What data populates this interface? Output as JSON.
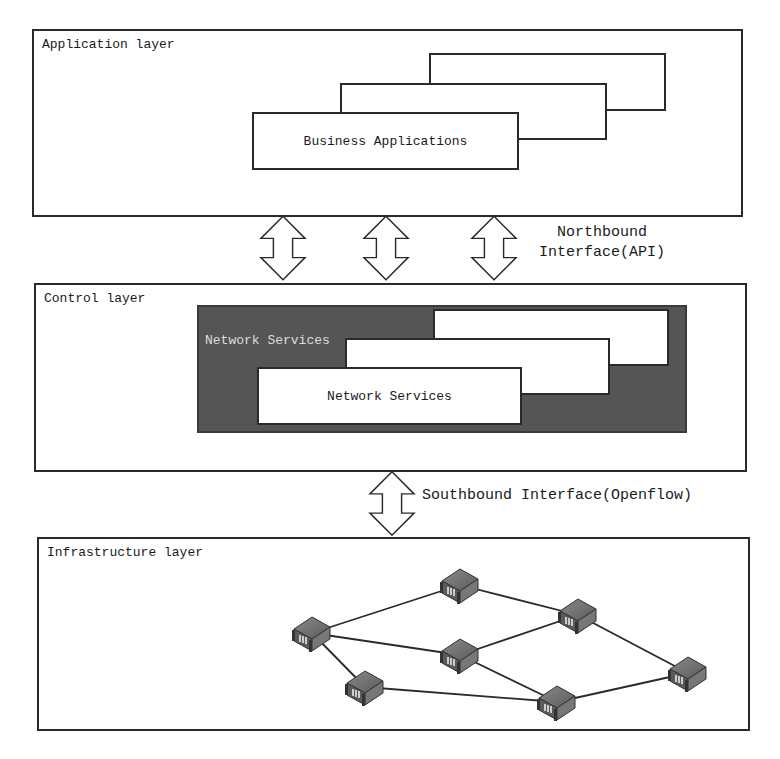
{
  "application_layer": {
    "title": "Application layer",
    "front_box_label": "Business Applications"
  },
  "northbound": {
    "line1": "Northbound",
    "line2": "Interface(API)"
  },
  "control_layer": {
    "title": "Control layer",
    "dark_panel_label": "Network Services",
    "front_box_label": "Network Services"
  },
  "southbound": {
    "label": "Southbound Interface(Openflow)"
  },
  "infrastructure_layer": {
    "title": "Infrastructure layer",
    "nodes": [
      {
        "id": "n1",
        "x": 312,
        "y": 633
      },
      {
        "id": "n2",
        "x": 460,
        "y": 585
      },
      {
        "id": "n3",
        "x": 578,
        "y": 615
      },
      {
        "id": "n4",
        "x": 460,
        "y": 655
      },
      {
        "id": "n5",
        "x": 365,
        "y": 687
      },
      {
        "id": "n6",
        "x": 557,
        "y": 702
      },
      {
        "id": "n7",
        "x": 688,
        "y": 673
      }
    ],
    "edges": [
      [
        "n1",
        "n2"
      ],
      [
        "n1",
        "n4"
      ],
      [
        "n1",
        "n5"
      ],
      [
        "n2",
        "n3"
      ],
      [
        "n4",
        "n3"
      ],
      [
        "n4",
        "n6"
      ],
      [
        "n5",
        "n6"
      ],
      [
        "n3",
        "n7"
      ],
      [
        "n6",
        "n7"
      ]
    ]
  },
  "colors": {
    "line": "#2a2a2a",
    "dark_panel": "#555555",
    "node": "#6e6e6e"
  }
}
